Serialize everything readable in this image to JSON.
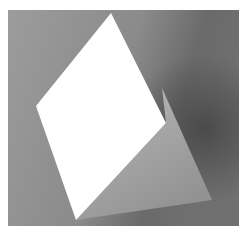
{
  "image": {
    "subject": "folded white card standing on gray surface",
    "colors": {
      "page_background": "#ffffff",
      "backdrop_light": "#9a9a9a",
      "backdrop_mid": "#8a8a8a",
      "backdrop_dark": "#5e5e5e",
      "card_front": "#ffffff",
      "card_back_light": "#b4b4b4",
      "card_back_dark": "#8c8c8c"
    }
  }
}
